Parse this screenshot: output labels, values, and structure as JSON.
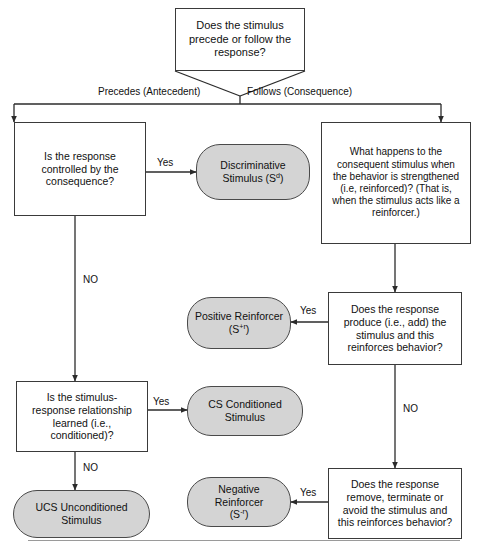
{
  "diagram": {
    "colors": {
      "pill_fill": "#d4d4d4",
      "rect_fill": "#ffffff",
      "stroke": "#3a3a3a",
      "text": "#111111"
    },
    "nodes": [
      {
        "id": "q_precede",
        "shape": "rect",
        "text": "Does the stimulus\nprecede or follow the\nresponse?"
      },
      {
        "id": "q_controlled",
        "shape": "rect",
        "text": "Is the response\ncontrolled by the\nconsequence?"
      },
      {
        "id": "out_sd",
        "shape": "pill",
        "text_html": "Discriminative\nStimulus (S<sup>d</sup>)",
        "text": "Discriminative Stimulus (Sd)"
      },
      {
        "id": "q_what_happens",
        "shape": "rect",
        "text": "What happens to the\nconsequent stimulus when\nthe behavior is strengthened\n(i.e, reinforced)? (That is,\nwhen the stimulus acts like a\nreinforcer.)"
      },
      {
        "id": "q_produce",
        "shape": "rect",
        "text": "Does the response\nproduce (i.e., add) the\nstimulus and this\nreinforces behavior?"
      },
      {
        "id": "out_pos",
        "shape": "pill",
        "text_html": "Positive Reinforcer\n(S<sup>+r</sup>)",
        "text": "Positive Reinforcer (S+r)"
      },
      {
        "id": "q_learned",
        "shape": "rect",
        "text": "Is the stimulus-\nresponse relationship\nlearned (i.e.,\nconditioned)?"
      },
      {
        "id": "out_cs",
        "shape": "pill",
        "text_html": "CS Conditioned\nStimulus",
        "text": "CS Conditioned Stimulus"
      },
      {
        "id": "out_ucs",
        "shape": "pill",
        "text_html": "UCS Unconditioned\nStimulus",
        "text": "UCS Unconditioned Stimulus"
      },
      {
        "id": "q_remove",
        "shape": "rect",
        "text": "Does the response\nremove, terminate or\navoid the stimulus and\nthis reinforces behavior?"
      },
      {
        "id": "out_neg",
        "shape": "pill",
        "text_html": "Negative Reinforcer\n(S<sup>-r</sup>)",
        "text": "Negative Reinforcer (S-r)"
      }
    ],
    "edge_labels": {
      "precedes": "Precedes (Antecedent)",
      "follows": "Follows (Consequence)",
      "yes_sd": "Yes",
      "no_controlled": "NO",
      "yes_pos": "Yes",
      "no_produce": "NO",
      "yes_cs": "Yes",
      "no_learned": "NO",
      "yes_neg": "Yes"
    }
  }
}
